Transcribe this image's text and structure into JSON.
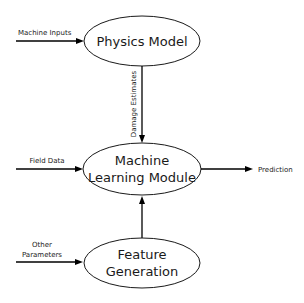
{
  "diagram": {
    "nodes": {
      "physics_model": {
        "lines": [
          "Physics Model"
        ]
      },
      "ml_module": {
        "lines": [
          "Machine",
          "Learning Module"
        ]
      },
      "feature_generation": {
        "lines": [
          "Feature",
          "Generation"
        ]
      }
    },
    "edges": {
      "machine_inputs": {
        "label": "Machine Inputs",
        "from": "external",
        "to": "physics_model"
      },
      "damage_estimates": {
        "label": "Damage Estimates",
        "from": "physics_model",
        "to": "ml_module"
      },
      "field_data": {
        "label": "Field Data",
        "from": "external",
        "to": "ml_module"
      },
      "prediction": {
        "label": "Prediction",
        "from": "ml_module",
        "to": "output"
      },
      "other_parameters": {
        "label_lines": [
          "Other",
          "Parameters"
        ],
        "from": "external",
        "to": "feature_generation"
      },
      "features": {
        "label": "",
        "from": "feature_generation",
        "to": "ml_module"
      }
    },
    "colors": {
      "stroke": "#000000",
      "text": "#1a1a1a",
      "background": "#ffffff"
    }
  }
}
